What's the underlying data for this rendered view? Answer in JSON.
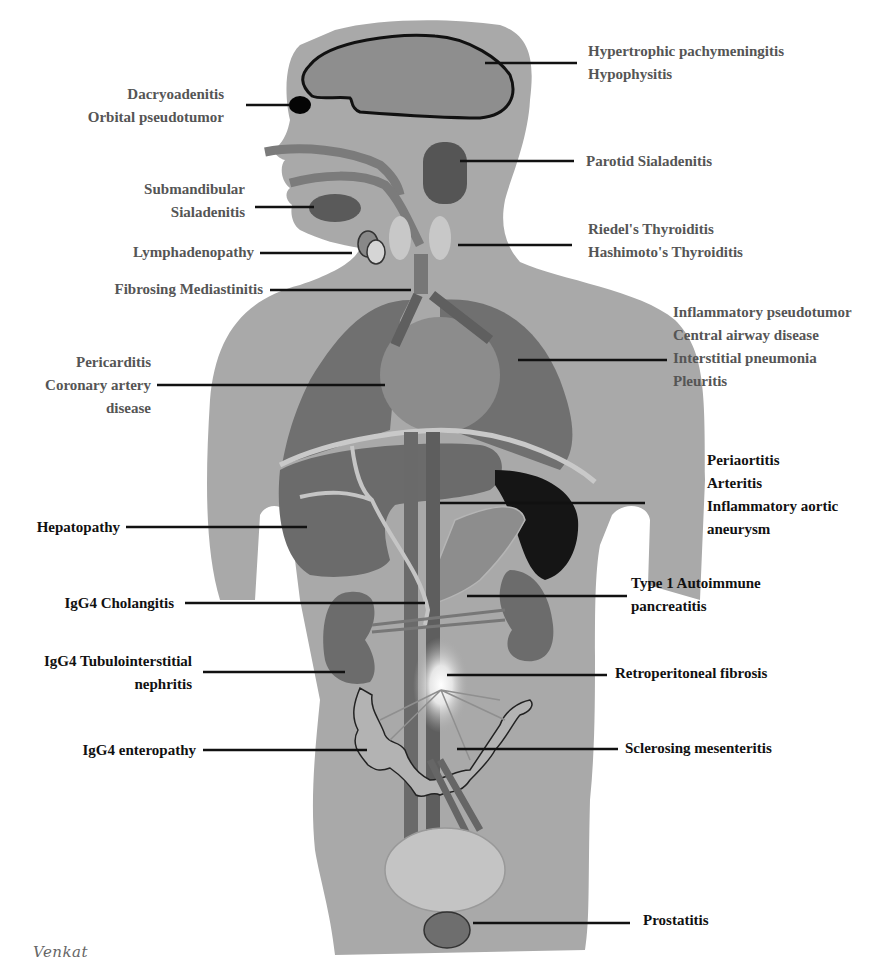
{
  "figure": {
    "colors": {
      "body": "#a9a9a9",
      "organ_dark": "#6e6e6e",
      "organ_mid": "#858585",
      "spleen": "#151515",
      "bladder": "#c4c4c4",
      "label_gray": "#555555",
      "label_dark": "#111111"
    }
  },
  "labels": {
    "left": [
      {
        "id": "eye",
        "lines": [
          "Dacryoadenitis",
          "Orbital pseudotumor"
        ]
      },
      {
        "id": "submandibular",
        "lines": [
          "Submandibular",
          "Sialadenitis"
        ]
      },
      {
        "id": "lymph",
        "lines": [
          "Lymphadenopathy"
        ]
      },
      {
        "id": "mediastinum",
        "lines": [
          "Fibrosing Mediastinitis"
        ]
      },
      {
        "id": "heart",
        "lines": [
          "Pericarditis",
          "Coronary artery",
          "disease"
        ]
      },
      {
        "id": "liver",
        "lines": [
          "Hepatopathy"
        ]
      },
      {
        "id": "bile",
        "lines": [
          "IgG4 Cholangitis"
        ]
      },
      {
        "id": "kidney",
        "lines": [
          "IgG4 Tubulointerstitial",
          "nephritis"
        ]
      },
      {
        "id": "intestine",
        "lines": [
          "IgG4 enteropathy"
        ]
      }
    ],
    "right": [
      {
        "id": "brain",
        "lines": [
          "Hypertrophic pachymeningitis",
          "Hypophysitis"
        ]
      },
      {
        "id": "parotid",
        "lines": [
          "Parotid Sialadenitis"
        ]
      },
      {
        "id": "thyroid",
        "lines": [
          "Riedel's Thyroiditis",
          "Hashimoto's Thyroiditis"
        ]
      },
      {
        "id": "lung",
        "lines": [
          "Inflammatory pseudotumor",
          "Central airway disease",
          "Interstitial pneumonia",
          "Pleuritis"
        ]
      },
      {
        "id": "aorta",
        "lines": [
          "Periaortitis",
          "Arteritis",
          "Inflammatory aortic",
          "aneurysm"
        ]
      },
      {
        "id": "pancreas",
        "lines": [
          "Type 1 Autoimmune",
          "pancreatitis"
        ]
      },
      {
        "id": "retro",
        "lines": [
          "Retroperitoneal fibrosis"
        ]
      },
      {
        "id": "mesentery",
        "lines": [
          "Sclerosing mesenteritis"
        ]
      },
      {
        "id": "prostate",
        "lines": [
          "Prostatitis"
        ]
      }
    ]
  },
  "signature": "Venkat"
}
